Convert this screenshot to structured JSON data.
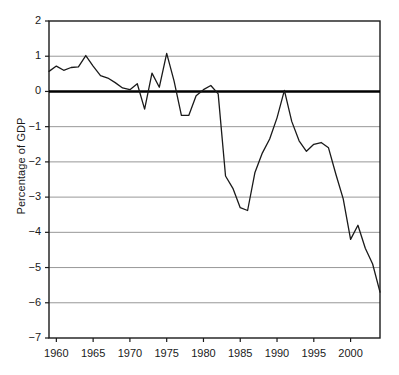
{
  "chart_data": {
    "type": "line",
    "title": "",
    "subtitle": "",
    "xlabel": "",
    "ylabel": "Percentage of GDP",
    "xlim": [
      1959,
      2004
    ],
    "ylim": [
      -7,
      2
    ],
    "yticks": [
      2,
      1,
      0,
      -1,
      -2,
      -3,
      -4,
      -5,
      -6,
      -7
    ],
    "ytick_labels": [
      "2",
      "1",
      "0",
      "−1",
      "−2",
      "−3",
      "−4",
      "−5",
      "−6",
      "−7"
    ],
    "xticks": [
      1960,
      1965,
      1970,
      1975,
      1980,
      1985,
      1990,
      1995,
      2000
    ],
    "xtick_labels": [
      "1960",
      "1965",
      "1970",
      "1975",
      "1980",
      "1985",
      "1990",
      "1995",
      "2000"
    ],
    "grid": "horizontal",
    "grid_color": "#8c8c8c",
    "zero_line": true,
    "zero_line_color": "#000000",
    "legend": "none",
    "line_color": "#1a1a1a",
    "series": [
      {
        "name": "Percentage of GDP",
        "x": [
          1959,
          1960,
          1961,
          1962,
          1963,
          1964,
          1965,
          1966,
          1967,
          1968,
          1969,
          1970,
          1971,
          1972,
          1973,
          1974,
          1975,
          1976,
          1977,
          1978,
          1979,
          1980,
          1981,
          1982,
          1983,
          1984,
          1985,
          1986,
          1987,
          1988,
          1989,
          1990,
          1991,
          1992,
          1993,
          1994,
          1995,
          1996,
          1997,
          1998,
          1999,
          2000,
          2001,
          2002,
          2003,
          2004
        ],
        "values": [
          0.57,
          0.72,
          0.6,
          0.68,
          0.7,
          1.02,
          0.72,
          0.45,
          0.38,
          0.25,
          0.1,
          0.05,
          0.22,
          -0.5,
          0.52,
          0.12,
          1.08,
          0.3,
          -0.68,
          -0.68,
          -0.12,
          0.05,
          0.17,
          -0.07,
          -2.4,
          -2.75,
          -3.3,
          -3.38,
          -2.3,
          -1.75,
          -1.35,
          -0.75,
          0.03,
          -0.85,
          -1.4,
          -1.7,
          -1.5,
          -1.45,
          -1.6,
          -2.35,
          -3.05,
          -4.2,
          -3.8,
          -4.45,
          -4.9,
          -5.7
        ]
      }
    ]
  },
  "axes": {
    "plot_left": 49,
    "plot_right": 380,
    "plot_top": 21,
    "plot_bottom": 338
  }
}
